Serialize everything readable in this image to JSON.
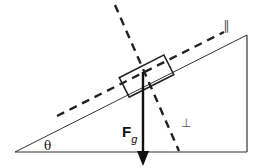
{
  "diagram": {
    "type": "inclined-plane-free-body",
    "labels": {
      "angle": "θ",
      "force_main": "F",
      "force_sub": "g",
      "parallel_axis": "∥",
      "perpendicular_axis": "⊥"
    },
    "colors": {
      "lines": "#222222",
      "dashed": "#222222",
      "background": "#ffffff"
    }
  }
}
